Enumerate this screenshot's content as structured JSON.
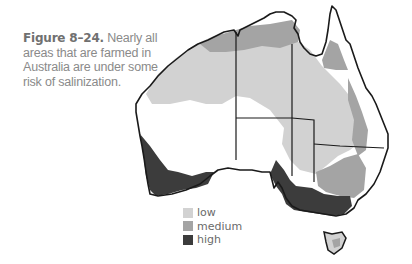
{
  "caption": {
    "figure_label": "Figure 8–24.",
    "text": "Nearly all areas that are farmed in Australia are under some risk of salinization."
  },
  "map": {
    "subject": "Australia salinization risk",
    "colors": {
      "outline": "#1a1a1a",
      "low": "#d2d2d2",
      "medium": "#a4a4a4",
      "high": "#3c3c3c",
      "background": "#ffffff"
    }
  },
  "legend": {
    "items": [
      {
        "label": "low",
        "color": "#d2d2d2"
      },
      {
        "label": "medium",
        "color": "#a4a4a4"
      },
      {
        "label": "high",
        "color": "#3c3c3c"
      }
    ]
  }
}
